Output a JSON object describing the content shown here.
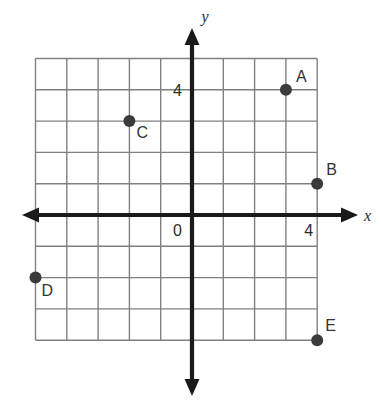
{
  "figure": {
    "kind": "coordinate-plane-plot",
    "axis_labels": {
      "x": "x",
      "y": "y"
    },
    "tick_labels": {
      "x_four": "4",
      "y_four": "4",
      "origin": "0"
    },
    "colors": {
      "grid": "#808080",
      "axis": "#1a1a1a",
      "point": "#3b3b3b",
      "label": "#333333",
      "background": "#ffffff"
    },
    "geometry": {
      "origin_px": {
        "x": 192,
        "y": 215
      },
      "cell_px": 31.3,
      "x_grid_min": -5,
      "x_grid_max": 4,
      "y_grid_min": -4,
      "y_grid_max": 5,
      "point_radius_px": 6
    },
    "points": [
      {
        "label": "A",
        "x": 3,
        "y": 4,
        "label_dx": 10,
        "label_dy": -8
      },
      {
        "label": "B",
        "x": 4,
        "y": 1,
        "label_dx": 9,
        "label_dy": -9
      },
      {
        "label": "C",
        "x": -2,
        "y": 3,
        "label_dx": 7,
        "label_dy": 17
      },
      {
        "label": "D",
        "x": -5,
        "y": -2,
        "label_dx": 6,
        "label_dy": 18
      },
      {
        "label": "E",
        "x": 4,
        "y": -4,
        "label_dx": 8,
        "label_dy": -9
      }
    ]
  }
}
